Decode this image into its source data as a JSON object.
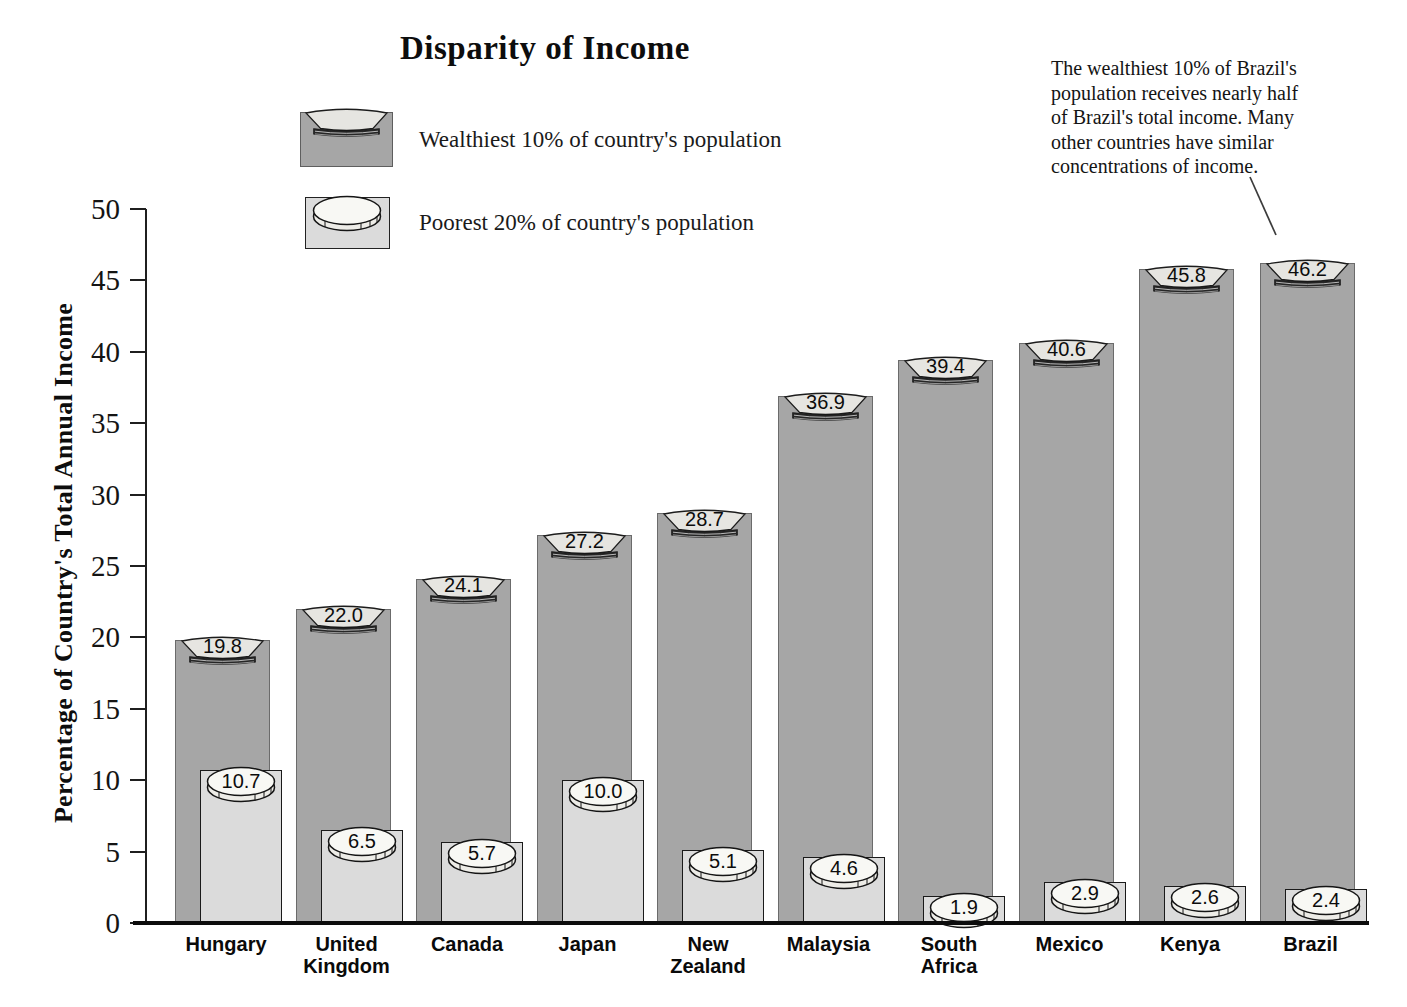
{
  "title": "Disparity of Income",
  "legend": {
    "items": [
      {
        "label": "Wealthiest 10% of country's population"
      },
      {
        "label": "Poorest 20% of country's population"
      }
    ]
  },
  "annotation": {
    "text": "The wealthiest 10% of Brazil's\npopulation receives nearly half\nof Brazil's total income.  Many\nother countries have similar\nconcentrations of income."
  },
  "y_axis": {
    "label": "Percentage of Country's Total Annual Income",
    "ticks": [
      0,
      5,
      10,
      15,
      20,
      25,
      30,
      35,
      40,
      45,
      50
    ]
  },
  "chart_data": {
    "type": "bar",
    "title": "Disparity of Income",
    "categories": [
      "Hungary",
      "United Kingdom",
      "Canada",
      "Japan",
      "New Zealand",
      "Malaysia",
      "South Africa",
      "Mexico",
      "Kenya",
      "Brazil"
    ],
    "categories_display": [
      "Hungary",
      "United\nKingdom",
      "Canada",
      "Japan",
      "New\nZealand",
      "Malaysia",
      "South\nAfrica",
      "Mexico",
      "Kenya",
      "Brazil"
    ],
    "series": [
      {
        "name": "Wealthiest 10% of country's population",
        "values": [
          19.8,
          22.0,
          24.1,
          27.2,
          28.7,
          36.9,
          39.4,
          40.6,
          45.8,
          46.2
        ]
      },
      {
        "name": "Poorest 20% of country's population",
        "values": [
          10.7,
          6.5,
          5.7,
          10.0,
          5.1,
          4.6,
          1.9,
          2.9,
          2.6,
          2.4
        ]
      }
    ],
    "xlabel": "",
    "ylabel": "Percentage of Country's Total Annual Income",
    "ylim": [
      0,
      50
    ],
    "ytick_step": 5,
    "grid": false,
    "legend_position": "top-left"
  },
  "colors": {
    "dark_bar": "#a6a6a6",
    "light_bar": "#dbdbdb",
    "cap_fill": "#e6e5e1",
    "disc_fill": "#f8f8f4",
    "disc_rim": "#edece7",
    "hatch_band": "#262626",
    "axis": "#1f1f1f",
    "text": "#141414",
    "background": "#ffffff"
  }
}
